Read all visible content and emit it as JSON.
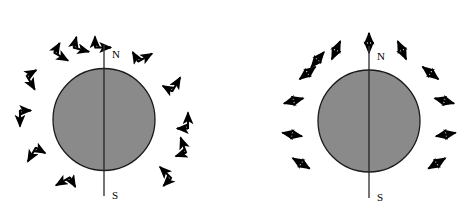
{
  "figure": {
    "title": "",
    "background_color": "#ffffff",
    "width": 465,
    "height": 218,
    "panel_count": 2
  },
  "style": {
    "sphere_fill": "#8a8a8a",
    "sphere_stroke": "#1a1a1a",
    "axis_color": "#3a3a3a",
    "arrow_color": "#000000",
    "label_color": "#000000"
  },
  "panels": [
    {
      "id": "left-panel",
      "name": "tangential-polarization-diagram",
      "sphere": {
        "cx": 104,
        "cy": 119.5,
        "r": 51,
        "fill": "#8a8a8a",
        "stroke": "#1a1a1a"
      },
      "axis": {
        "x_top": 104,
        "y_top": 45,
        "x_bottom": 104,
        "y_bottom": 196,
        "tilt_deg": 0
      },
      "labels": {
        "north": "N",
        "south": "S",
        "north_x": 112,
        "north_y": 58,
        "south_x": 112,
        "south_y": 199
      },
      "arrow_kind": "bent-L-double-headed",
      "arrow_count": 12,
      "arrows": [
        {
          "angle_deg": 90,
          "dist": 78,
          "rot": 0,
          "label": "arrow-top"
        },
        {
          "angle_deg": 120,
          "dist": 78,
          "rot": 30,
          "label": "arrow-upper-left-1"
        },
        {
          "angle_deg": 150,
          "dist": 78,
          "rot": 60,
          "label": "arrow-upper-left-2"
        },
        {
          "angle_deg": 180,
          "dist": 78,
          "rot": 90,
          "label": "arrow-left"
        },
        {
          "angle_deg": 210,
          "dist": 78,
          "rot": 120,
          "label": "arrow-lower-left-1"
        },
        {
          "angle_deg": 240,
          "dist": 78,
          "rot": 150,
          "label": "arrow-lower-left-2"
        },
        {
          "angle_deg": 60,
          "dist": 78,
          "rot": 330,
          "label": "arrow-upper-right-1"
        },
        {
          "angle_deg": 30,
          "dist": 78,
          "rot": 300,
          "label": "arrow-upper-right-2"
        },
        {
          "angle_deg": 0,
          "dist": 78,
          "rot": 270,
          "label": "arrow-right"
        },
        {
          "angle_deg": 340,
          "dist": 78,
          "rot": 250,
          "label": "arrow-lower-right-1"
        },
        {
          "angle_deg": 315,
          "dist": 80,
          "rot": 225,
          "label": "arrow-lower-right-2"
        },
        {
          "angle_deg": 105,
          "dist": 78,
          "rot": 15,
          "label": "arrow-top-left-near"
        }
      ]
    },
    {
      "id": "right-panel",
      "name": "radial-polarization-diagram",
      "sphere": {
        "cx": 369,
        "cy": 121,
        "r": 51,
        "fill": "#8a8a8a",
        "stroke": "#1a1a1a"
      },
      "axis": {
        "x_top": 369,
        "y_top": 46,
        "x_bottom": 369,
        "y_bottom": 198,
        "tilt_deg": 0
      },
      "labels": {
        "north": "N",
        "south": "S",
        "north_x": 377,
        "north_y": 60,
        "south_x": 377,
        "south_y": 201
      },
      "arrow_kind": "radial-double-headed",
      "arrow_count": 12,
      "arrows": [
        {
          "angle_deg": 90,
          "dist": 78,
          "rot": 90,
          "label": "arrow-top"
        },
        {
          "angle_deg": 115,
          "dist": 78,
          "rot": 115,
          "label": "arrow-upper-left-1"
        },
        {
          "angle_deg": 142,
          "dist": 78,
          "rot": 142,
          "label": "arrow-upper-left-2"
        },
        {
          "angle_deg": 165,
          "dist": 78,
          "rot": 165,
          "label": "arrow-upper-left-3"
        },
        {
          "angle_deg": 190,
          "dist": 78,
          "rot": 190,
          "label": "arrow-left"
        },
        {
          "angle_deg": 65,
          "dist": 78,
          "rot": 65,
          "label": "arrow-upper-right-1"
        },
        {
          "angle_deg": 38,
          "dist": 78,
          "rot": 38,
          "label": "arrow-upper-right-2"
        },
        {
          "angle_deg": 15,
          "dist": 78,
          "rot": 15,
          "label": "arrow-right-1"
        },
        {
          "angle_deg": 350,
          "dist": 78,
          "rot": 350,
          "label": "arrow-right-2"
        },
        {
          "angle_deg": 212,
          "dist": 80,
          "rot": 212,
          "label": "arrow-lower-left-1"
        },
        {
          "angle_deg": 328,
          "dist": 80,
          "rot": 328,
          "label": "arrow-lower-right-1"
        },
        {
          "angle_deg": 130,
          "dist": 80,
          "rot": 130,
          "label": "arrow-upper-left-4"
        }
      ]
    }
  ]
}
